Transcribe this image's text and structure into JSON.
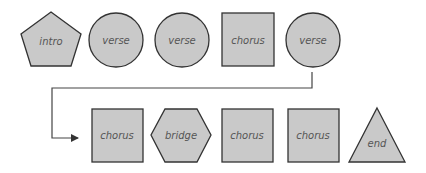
{
  "diagram": {
    "type": "song-structure flow",
    "colors": {
      "fill": "#c9c9c9",
      "stroke": "#333333",
      "text": "#555555",
      "connector": "#444444"
    },
    "row1": [
      {
        "label": "intro",
        "shape": "pentagon"
      },
      {
        "label": "verse",
        "shape": "circle"
      },
      {
        "label": "verse",
        "shape": "circle"
      },
      {
        "label": "chorus",
        "shape": "square"
      },
      {
        "label": "verse",
        "shape": "circle"
      }
    ],
    "row2": [
      {
        "label": "chorus",
        "shape": "square"
      },
      {
        "label": "bridge",
        "shape": "hexagon"
      },
      {
        "label": "chorus",
        "shape": "square"
      },
      {
        "label": "chorus",
        "shape": "square"
      },
      {
        "label": "end",
        "shape": "triangle"
      }
    ],
    "connector": {
      "from": "verse (row 1, last)",
      "to": "chorus (row 2, first)",
      "style": "elbow arrow"
    }
  }
}
